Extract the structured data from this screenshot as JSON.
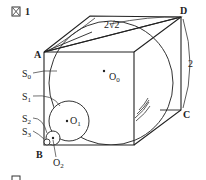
{
  "figure": {
    "next_title_partial": "図 2",
    "vertices": {
      "A": "A",
      "B": "B",
      "C": "C",
      "D": "D"
    },
    "dimensions": {
      "diagonal": "2√2",
      "edge": "2"
    },
    "spheres": [
      "S0",
      "S1",
      "S2",
      "S3"
    ],
    "sphere_labels": {
      "S0": "S",
      "S0_sub": "0",
      "S1": "S",
      "S1_sub": "1",
      "S2": "S",
      "S2_sub": "2",
      "S3": "S",
      "S3_sub": "3"
    },
    "centers": {
      "O0": "O",
      "O0_sub": "0",
      "O1": "O",
      "O1_sub": "1",
      "O2": "O",
      "O2_sub": "2"
    }
  }
}
